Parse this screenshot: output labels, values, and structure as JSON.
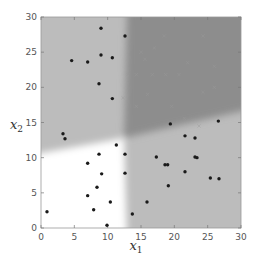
{
  "chart_data": {
    "type": "scatter",
    "title": "",
    "xlabel": "x1",
    "ylabel": "x2",
    "xlabel_main": "x",
    "xlabel_sub": "1",
    "ylabel_main": "x",
    "ylabel_sub": "2",
    "xlim": [
      0,
      30
    ],
    "ylim": [
      0,
      30
    ],
    "xticks": [
      0,
      5,
      10,
      15,
      20,
      25,
      30
    ],
    "yticks": [
      0,
      5,
      10,
      15,
      20,
      25,
      30
    ],
    "grid": false,
    "legend": null,
    "background_regions": [
      {
        "name": "white-region",
        "description": "x1 < ~12 and x2 < ~11-13 (boundary slopes upward to the right)",
        "color": "#ffffff"
      },
      {
        "name": "light-gray-region-upper-left",
        "description": "x1 < ~12, x2 above ~11-13",
        "color": "#bdbdbd"
      },
      {
        "name": "light-gray-region-lower-right",
        "description": "x1 > ~12, x2 below ~13-17 (boundary slopes up to the right)",
        "color": "#bdbdbd"
      },
      {
        "name": "dark-gray-region",
        "description": "x1 > ~12 and x2 above boundary",
        "color": "#8e8e8e"
      }
    ],
    "series": [
      {
        "name": "dots",
        "marker": "circle",
        "color": "#1a1a1a",
        "points": [
          [
            0.9,
            2.3
          ],
          [
            9.0,
            28.4
          ],
          [
            4.6,
            23.8
          ],
          [
            7.0,
            23.6
          ],
          [
            9.0,
            24.6
          ],
          [
            10.7,
            24.2
          ],
          [
            8.7,
            20.5
          ],
          [
            10.7,
            18.4
          ],
          [
            12.6,
            27.3
          ],
          [
            3.3,
            13.4
          ],
          [
            3.6,
            12.7
          ],
          [
            11.3,
            11.8
          ],
          [
            8.7,
            10.5
          ],
          [
            7.0,
            9.2
          ],
          [
            9.1,
            7.7
          ],
          [
            7.0,
            4.6
          ],
          [
            8.4,
            5.8
          ],
          [
            7.9,
            2.6
          ],
          [
            9.9,
            0.4
          ],
          [
            10.4,
            3.7
          ],
          [
            12.6,
            10.5
          ],
          [
            12.6,
            7.8
          ],
          [
            13.7,
            2.0
          ],
          [
            15.9,
            3.7
          ],
          [
            17.3,
            10.1
          ],
          [
            18.6,
            9.0
          ],
          [
            19.0,
            9.0
          ],
          [
            19.4,
            14.8
          ],
          [
            19.1,
            6.0
          ],
          [
            21.6,
            13.1
          ],
          [
            21.6,
            8.0
          ],
          [
            23.1,
            12.8
          ],
          [
            23.4,
            10.0
          ],
          [
            23.1,
            10.1
          ],
          [
            25.4,
            7.1
          ],
          [
            26.7,
            7.0
          ],
          [
            26.6,
            15.2
          ]
        ]
      },
      {
        "name": "crosses",
        "marker": "x",
        "color": "#9a9a9a",
        "points": [
          [
            13.0,
            21.8
          ],
          [
            14.3,
            21.8
          ],
          [
            16.7,
            21.8
          ],
          [
            18.7,
            21.8
          ],
          [
            20.7,
            21.8
          ],
          [
            24.3,
            19.3
          ],
          [
            22.0,
            23.5
          ],
          [
            17.0,
            25.6
          ],
          [
            15.0,
            25.0
          ],
          [
            26.0,
            20.0
          ],
          [
            14.3,
            17.3
          ],
          [
            19.6,
            17.3
          ],
          [
            21.5,
            15.6
          ],
          [
            23.7,
            14.5
          ],
          [
            12.3,
            18.5
          ],
          [
            18.5,
            27.3
          ],
          [
            15.6,
            24.0
          ],
          [
            24.3,
            27.3
          ],
          [
            26.0,
            23.0
          ],
          [
            16.0,
            19.0
          ]
        ]
      }
    ]
  }
}
